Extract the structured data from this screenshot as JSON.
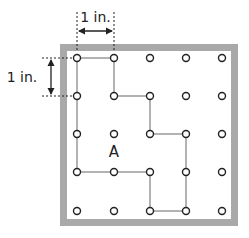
{
  "diagram": {
    "horizontal_dimension_label": "1 in.",
    "vertical_dimension_label": "1 in.",
    "region_label": "A",
    "grid": {
      "columns": 5,
      "rows": 5
    },
    "enclosed_path_points": [
      [
        0,
        0
      ],
      [
        1,
        0
      ],
      [
        1,
        1
      ],
      [
        2,
        1
      ],
      [
        2,
        2
      ],
      [
        3,
        2
      ],
      [
        3,
        3
      ],
      [
        3,
        4
      ],
      [
        2,
        4
      ],
      [
        2,
        3
      ],
      [
        1,
        3
      ],
      [
        0,
        3
      ],
      [
        0,
        2
      ],
      [
        0,
        1
      ],
      [
        0,
        0
      ]
    ],
    "colors": {
      "frame": "#a9a9a9",
      "path": "#9a9a9a",
      "dot_stroke": "#222222",
      "text": "#222222"
    }
  }
}
